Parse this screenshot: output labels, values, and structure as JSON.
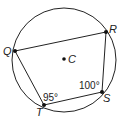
{
  "diagram": {
    "type": "inscribed-quadrilateral",
    "circle": {
      "center": [
        64,
        60
      ],
      "radius": 52
    },
    "center_point": {
      "label": "C",
      "pos": [
        64,
        59
      ]
    },
    "vertices": [
      {
        "label": "Q",
        "pos": [
          15,
          51
        ]
      },
      {
        "label": "R",
        "pos": [
          106,
          32
        ]
      },
      {
        "label": "S",
        "pos": [
          102,
          92
        ]
      },
      {
        "label": "T",
        "pos": [
          44,
          105
        ]
      }
    ],
    "angles": [
      {
        "vertex": "T",
        "label": "95°"
      },
      {
        "vertex": "S",
        "label": "100°"
      }
    ],
    "colors": {
      "stroke": "#222222",
      "background": "#ffffff"
    }
  }
}
